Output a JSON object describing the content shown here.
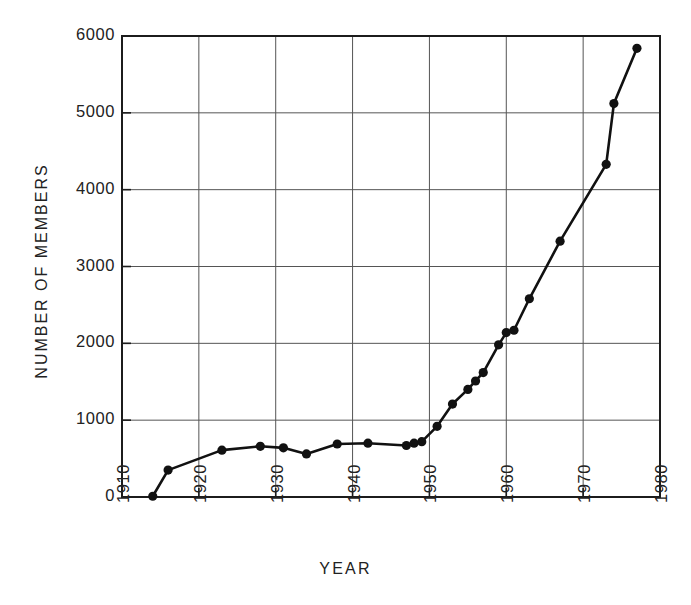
{
  "chart_data": {
    "type": "line",
    "title": "",
    "xlabel": "YEAR",
    "ylabel": "NUMBER OF MEMBERS",
    "xlim": [
      1910,
      1980
    ],
    "ylim": [
      0,
      6000
    ],
    "xticks": [
      "1910",
      "1920",
      "1930",
      "1940",
      "1950",
      "1960",
      "1970",
      "1980"
    ],
    "xtick_values": [
      1910,
      1920,
      1930,
      1940,
      1950,
      1960,
      1970,
      1980
    ],
    "yticks": [
      "0",
      "1000",
      "2000",
      "3000",
      "4000",
      "5000",
      "6000"
    ],
    "ytick_values": [
      0,
      1000,
      2000,
      3000,
      4000,
      5000,
      6000
    ],
    "grid": true,
    "legend": "none",
    "marker": "filled-circle",
    "line_color": "#111111",
    "marker_color": "#111111",
    "grid_color": "#555555",
    "x": [
      1914,
      1916,
      1923,
      1928,
      1931,
      1934,
      1938,
      1942,
      1947,
      1948,
      1949,
      1951,
      1953,
      1955,
      1956,
      1957,
      1959,
      1960,
      1961,
      1963,
      1965,
      1967,
      1970,
      1973,
      1974,
      1977
    ],
    "values": [
      10,
      350,
      610,
      660,
      640,
      560,
      690,
      700,
      670,
      700,
      720,
      920,
      1210,
      1400,
      1510,
      1620,
      1980,
      2140,
      2170,
      2580,
      3330,
      3330,
      4330,
      5120,
      5120,
      5840
    ],
    "points": [
      {
        "year": 1914,
        "members": 10
      },
      {
        "year": 1916,
        "members": 350
      },
      {
        "year": 1923,
        "members": 610
      },
      {
        "year": 1928,
        "members": 660
      },
      {
        "year": 1931,
        "members": 640
      },
      {
        "year": 1934,
        "members": 560
      },
      {
        "year": 1938,
        "members": 690
      },
      {
        "year": 1942,
        "members": 700
      },
      {
        "year": 1947,
        "members": 670
      },
      {
        "year": 1948,
        "members": 700
      },
      {
        "year": 1949,
        "members": 720
      },
      {
        "year": 1951,
        "members": 920
      },
      {
        "year": 1953,
        "members": 1210
      },
      {
        "year": 1955,
        "members": 1400
      },
      {
        "year": 1956,
        "members": 1510
      },
      {
        "year": 1957,
        "members": 1620
      },
      {
        "year": 1959,
        "members": 1980
      },
      {
        "year": 1960,
        "members": 2140
      },
      {
        "year": 1961,
        "members": 2170
      },
      {
        "year": 1963,
        "members": 2580
      },
      {
        "year": 1967,
        "members": 3330
      },
      {
        "year": 1973,
        "members": 4330
      },
      {
        "year": 1974,
        "members": 5120
      },
      {
        "year": 1977,
        "members": 5840
      }
    ]
  }
}
